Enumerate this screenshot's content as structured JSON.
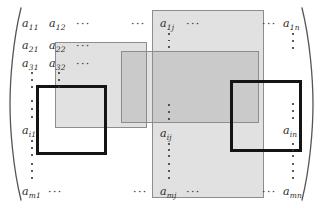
{
  "figure": {
    "type": "matrix-diagram",
    "bracket_left": "(",
    "bracket_right": ")"
  },
  "matrix": {
    "rows": "m",
    "cols": "n",
    "entries": [
      {
        "name": "a-1-1",
        "base": "a",
        "sub": "11",
        "x": 22,
        "y": 18
      },
      {
        "name": "a-1-2",
        "base": "a",
        "sub": "12",
        "x": 49,
        "y": 18
      },
      {
        "name": "a-1-j",
        "base": "a",
        "sub": "1j",
        "x": 160,
        "y": 18
      },
      {
        "name": "a-1-n",
        "base": "a",
        "sub": "1n",
        "x": 283,
        "y": 18
      },
      {
        "name": "a-2-1",
        "base": "a",
        "sub": "21",
        "x": 22,
        "y": 40
      },
      {
        "name": "a-2-2",
        "base": "a",
        "sub": "22",
        "x": 49,
        "y": 40
      },
      {
        "name": "a-3-1",
        "base": "a",
        "sub": "31",
        "x": 22,
        "y": 58
      },
      {
        "name": "a-3-2",
        "base": "a",
        "sub": "32",
        "x": 49,
        "y": 58
      },
      {
        "name": "a-i-1",
        "base": "a",
        "sub": "i1",
        "x": 22,
        "y": 125
      },
      {
        "name": "a-i-j",
        "base": "a",
        "sub": "ij",
        "x": 160,
        "y": 128
      },
      {
        "name": "a-i-n",
        "base": "a",
        "sub": "in",
        "x": 283,
        "y": 125
      },
      {
        "name": "a-m-1",
        "base": "a",
        "sub": "m1",
        "x": 22,
        "y": 186
      },
      {
        "name": "a-m-j",
        "base": "a",
        "sub": "mj",
        "x": 160,
        "y": 186
      },
      {
        "name": "a-m-n",
        "base": "a",
        "sub": "mn",
        "x": 283,
        "y": 186
      }
    ],
    "horizontal_ellipses": [
      {
        "name": "hdots-row1-a",
        "text": "···",
        "x": 76,
        "y": 19
      },
      {
        "name": "hdots-row1-b",
        "text": "···",
        "x": 131,
        "y": 19
      },
      {
        "name": "hdots-row1-c",
        "text": "···",
        "x": 186,
        "y": 19
      },
      {
        "name": "hdots-row1-d",
        "text": "···",
        "x": 262,
        "y": 19
      },
      {
        "name": "hdots-row2",
        "text": "···",
        "x": 76,
        "y": 41
      },
      {
        "name": "hdots-row3",
        "text": "···",
        "x": 76,
        "y": 59
      },
      {
        "name": "hdots-rowm-a",
        "text": "···",
        "x": 48,
        "y": 187
      },
      {
        "name": "hdots-rowm-b",
        "text": "···",
        "x": 133,
        "y": 187
      },
      {
        "name": "hdots-rowm-c",
        "text": "···",
        "x": 186,
        "y": 187
      },
      {
        "name": "hdots-rowm-d",
        "text": "···",
        "x": 262,
        "y": 187
      }
    ],
    "vertical_ellipses": [
      {
        "name": "vdots-col1-upper",
        "x": 29,
        "y": 72,
        "h": 16
      },
      {
        "name": "vdots-col1-mid",
        "x": 29,
        "y": 100,
        "h": 18
      },
      {
        "name": "vdots-col1-lower",
        "x": 29,
        "y": 140,
        "h": 16
      },
      {
        "name": "vdots-col1-bottom",
        "x": 29,
        "y": 163,
        "h": 16
      },
      {
        "name": "vdots-col2-upper",
        "x": 56,
        "y": 72,
        "h": 16
      },
      {
        "name": "vdots-colj-upper",
        "x": 166,
        "y": 33,
        "h": 15
      },
      {
        "name": "vdots-colj-mid",
        "x": 166,
        "y": 104,
        "h": 16
      },
      {
        "name": "vdots-colj-lower",
        "x": 166,
        "y": 143,
        "h": 14
      },
      {
        "name": "vdots-colj-bottom",
        "x": 166,
        "y": 163,
        "h": 16
      },
      {
        "name": "vdots-coln-upper",
        "x": 290,
        "y": 33,
        "h": 16
      },
      {
        "name": "vdots-coln-mid",
        "x": 290,
        "y": 103,
        "h": 16
      },
      {
        "name": "vdots-coln-lower",
        "x": 290,
        "y": 143,
        "h": 14
      },
      {
        "name": "vdots-coln-bottom",
        "x": 290,
        "y": 163,
        "h": 16
      }
    ]
  },
  "highlights": [
    {
      "name": "highlight-upper-left-block",
      "x": 55,
      "y": 42,
      "w": 92,
      "h": 86
    },
    {
      "name": "highlight-column-j",
      "x": 152,
      "y": 10,
      "w": 112,
      "h": 188
    },
    {
      "name": "highlight-row-i",
      "x": 121,
      "y": 51,
      "w": 138,
      "h": 72
    }
  ],
  "blocks": [
    {
      "name": "block-outline-left",
      "x": 36,
      "y": 85,
      "w": 71,
      "h": 70
    },
    {
      "name": "block-outline-right",
      "x": 230,
      "y": 80,
      "w": 72,
      "h": 72
    }
  ],
  "colors": {
    "highlight_fill": "#8c8c8c",
    "highlight_stroke": "#8d8d8d",
    "block_stroke": "#141414",
    "text": "#2b2b2b",
    "background": "#ffffff"
  }
}
